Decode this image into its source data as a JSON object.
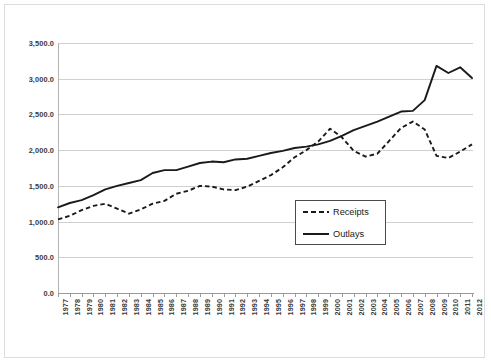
{
  "chart_data": {
    "type": "line",
    "title": "",
    "subtitle": "",
    "xlabel": "",
    "ylabel": "",
    "ylim": [
      0,
      3500
    ],
    "ytick_labels": [
      "3,500.0",
      "3,000.0",
      "2,500.0",
      "2,000.0",
      "1,500.0",
      "1,000.0",
      "500.0",
      "0.0"
    ],
    "ytick_values": [
      3500,
      3000,
      2500,
      2000,
      1500,
      1000,
      500,
      0
    ],
    "grid": true,
    "legend_position": "inside-center-right",
    "categories": [
      "1977",
      "1978",
      "1979",
      "1980",
      "1981",
      "1982",
      "1983",
      "1984",
      "1985",
      "1986",
      "1987",
      "1988",
      "1989",
      "1990",
      "1991",
      "1992",
      "1993",
      "1994",
      "1995",
      "1996",
      "1997",
      "1998",
      "1999",
      "2000",
      "2001",
      "2002",
      "2003",
      "2004",
      "2005",
      "2006",
      "2007",
      "2008",
      "2009",
      "2010",
      "2011",
      "2012"
    ],
    "series": [
      {
        "name": "Receipts",
        "style": "dashed",
        "color": "#1a1a1a",
        "values": [
          1030,
          1080,
          1160,
          1220,
          1250,
          1180,
          1110,
          1170,
          1250,
          1290,
          1390,
          1430,
          1500,
          1490,
          1450,
          1440,
          1490,
          1570,
          1650,
          1760,
          1900,
          2000,
          2120,
          2300,
          2180,
          1990,
          1910,
          1950,
          2130,
          2310,
          2400,
          2290,
          1920,
          1890,
          1980,
          2080
        ]
      },
      {
        "name": "Outlays",
        "style": "solid",
        "color": "#1a1a1a",
        "values": [
          1200,
          1260,
          1300,
          1370,
          1450,
          1500,
          1540,
          1580,
          1680,
          1720,
          1720,
          1770,
          1820,
          1840,
          1830,
          1870,
          1880,
          1920,
          1960,
          1990,
          2030,
          2050,
          2080,
          2130,
          2200,
          2280,
          2340,
          2400,
          2470,
          2540,
          2550,
          2700,
          3180,
          3080,
          3160,
          3010
        ]
      }
    ]
  },
  "legend": {
    "items": [
      {
        "label": "Receipts",
        "style": "dashed"
      },
      {
        "label": "Outlays",
        "style": "solid"
      }
    ]
  }
}
